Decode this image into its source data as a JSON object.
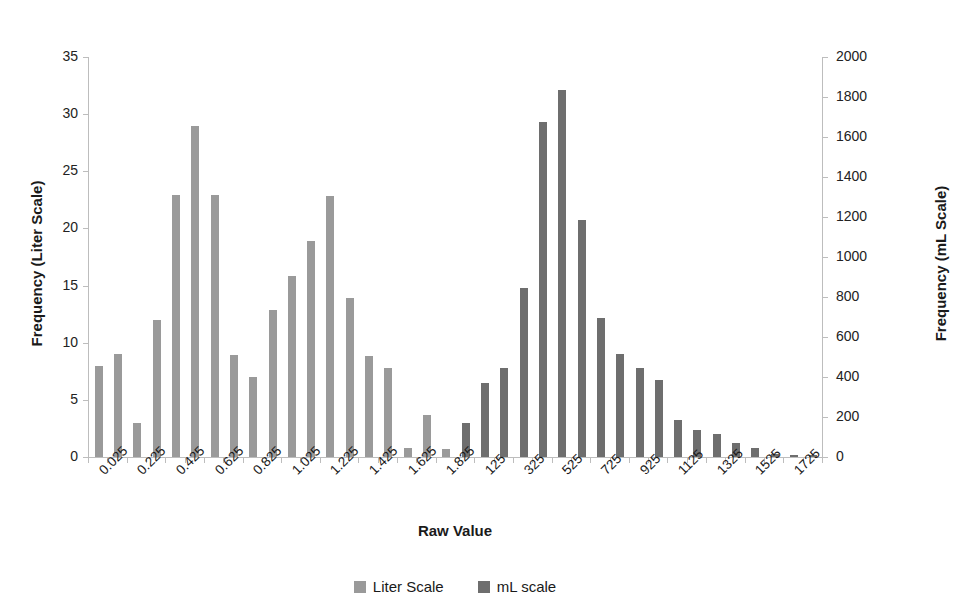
{
  "chart_data": {
    "type": "bar",
    "title": "",
    "xlabel": "Raw Value",
    "ylabel": "Frequency (Liter Scale)",
    "y2label": "Frequency (mL Scale)",
    "ylim": [
      0,
      35
    ],
    "y2lim": [
      0,
      2000
    ],
    "yticks": [
      0,
      5,
      10,
      15,
      20,
      25,
      30,
      35
    ],
    "y2ticks": [
      0,
      200,
      400,
      600,
      800,
      1000,
      1200,
      1400,
      1600,
      1800,
      2000
    ],
    "grid": false,
    "legend_position": "bottom",
    "xtick_labels": [
      "0.025",
      "0.225",
      "0.425",
      "0.625",
      "0.825",
      "1.025",
      "1.225",
      "1.425",
      "1.625",
      "1.825",
      "125",
      "325",
      "525",
      "725",
      "925",
      "1125",
      "1325",
      "1525",
      "1725"
    ],
    "xtick_label_every": 2,
    "series": [
      {
        "name": "Liter Scale",
        "color": "#9a9a9a",
        "axis": "left",
        "values": [
          8.0,
          9.0,
          3.0,
          12.0,
          22.9,
          29.0,
          22.9,
          8.9,
          7.0,
          12.9,
          15.8,
          18.9,
          22.8,
          13.9,
          8.8,
          7.8,
          0.8,
          3.7,
          0.7
        ]
      },
      {
        "name": "mL scale",
        "color": "#6e6e6e",
        "axis": "right",
        "values": [
          3.0,
          6.5,
          7.8,
          14.8,
          29.3,
          32.1,
          20.7,
          12.2,
          9.0,
          7.8,
          6.7,
          3.2,
          2.4,
          2.0,
          1.2,
          0.8,
          0.3,
          0.15,
          0.15
        ]
      }
    ],
    "n_categories": 38,
    "bar_pitch_px": 19.3,
    "bar_width_px": 8
  },
  "legend": {
    "items": [
      {
        "label": "Liter Scale",
        "color": "#9a9a9a"
      },
      {
        "label": "mL scale",
        "color": "#6e6e6e"
      }
    ]
  }
}
